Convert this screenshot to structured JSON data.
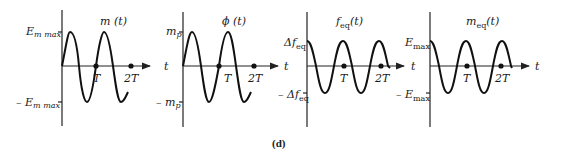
{
  "caption": "(d)",
  "panels": [
    {
      "id": "m",
      "title": "m (t)",
      "title_main": "m",
      "title_sub": "",
      "title_arg": " (t)",
      "y_top_label": "E",
      "y_top_sub": "m max",
      "y_bot_label": "– E",
      "y_bot_sub": "m max",
      "x_axis_label": "t",
      "ticks": [
        "T",
        "2T"
      ],
      "waveform": "sine"
    },
    {
      "id": "phi",
      "title": "ϕ (t)",
      "title_main": "ϕ",
      "title_sub": "",
      "title_arg": " (t)",
      "y_top_label": "m",
      "y_top_sub": "p",
      "y_bot_label": "– m",
      "y_bot_sub": "p",
      "x_axis_label": "t",
      "ticks": [
        "T",
        "2T"
      ],
      "waveform": "sine"
    },
    {
      "id": "feq",
      "title": "f_eq(t)",
      "title_main": "f",
      "title_sub": "eq",
      "title_arg": "(t)",
      "y_top_label": "Δf",
      "y_top_sub": "eq",
      "y_bot_label": "– Δf",
      "y_bot_sub": "eq",
      "x_axis_label": "t",
      "ticks": [
        "T",
        "2T"
      ],
      "waveform": "cosine"
    },
    {
      "id": "meq",
      "title": "m_eq(t)",
      "title_main": "m",
      "title_sub": "eq",
      "title_arg": "(t)",
      "y_top_label": "E",
      "y_top_sub": "max",
      "y_bot_label": "– E",
      "y_bot_sub": "max",
      "x_axis_label": "t",
      "ticks": [
        "T",
        "2T"
      ],
      "waveform": "cosine"
    }
  ]
}
